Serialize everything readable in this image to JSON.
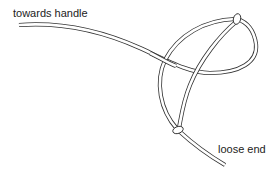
{
  "labels": {
    "handle": "towards handle",
    "loose_end": "loose end"
  },
  "diagram": {
    "type": "rope-loop-knot-illustration",
    "line_color": "#333333",
    "background": "#ffffff",
    "knots": [
      "top-knot",
      "bottom-knot"
    ]
  }
}
